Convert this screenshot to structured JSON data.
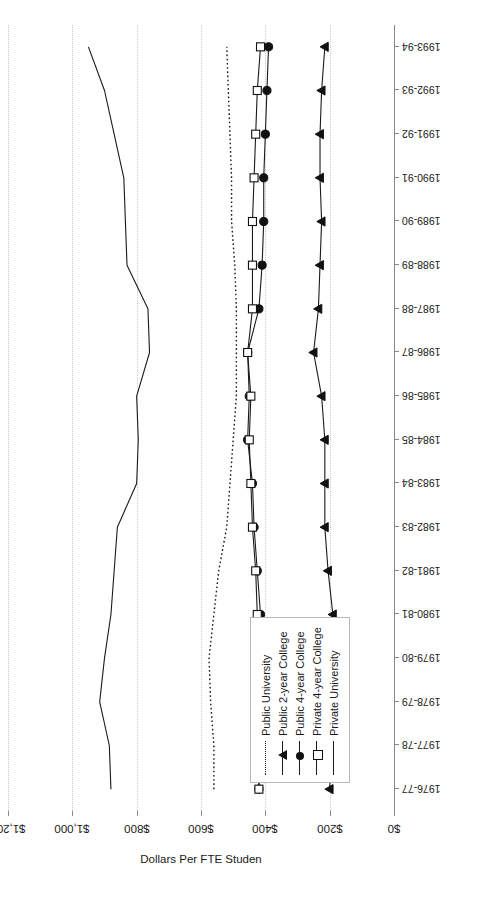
{
  "chart_data": {
    "type": "line",
    "title": "",
    "xlabel": "",
    "ylabel": "Dollars Per FTE Studen",
    "ylim": [
      0,
      1200
    ],
    "ytick_labels": [
      "$0",
      "$200",
      "$400",
      "$600",
      "$800",
      "$1,000",
      "$1,200"
    ],
    "yticks": [
      0,
      200,
      400,
      600,
      800,
      1000,
      1200
    ],
    "grid": true,
    "grid_axis": "y",
    "legend_position": "left-center",
    "orientation": "rotated-90",
    "categories": [
      "1976-77",
      "1977-78",
      "1978-79",
      "1979-80",
      "1980-81",
      "1981-82",
      "1982-83",
      "1983-84",
      "1984-85",
      "1985-86",
      "1986-87",
      "1987-88",
      "1988-89",
      "1989-90",
      "1990-91",
      "1991-92",
      "1992-93",
      "1993-94"
    ],
    "series": [
      {
        "name": "Public University",
        "marker": "none",
        "line": "dotted",
        "values": [
          560,
          560,
          570,
          575,
          560,
          545,
          520,
          510,
          500,
          490,
          490,
          490,
          495,
          505,
          505,
          510,
          515,
          520
        ]
      },
      {
        "name": "Public 2-year College",
        "marker": "triangle",
        "line": "solid",
        "values": [
          200,
          195,
          190,
          185,
          190,
          205,
          215,
          215,
          215,
          225,
          250,
          235,
          230,
          225,
          230,
          230,
          225,
          215
        ]
      },
      {
        "name": "Public 4-year College",
        "marker": "circle",
        "line": "solid",
        "values": [
          420,
          420,
          425,
          420,
          415,
          425,
          435,
          440,
          455,
          450,
          455,
          420,
          410,
          405,
          405,
          400,
          395,
          390
        ]
      },
      {
        "name": "Private 4-year College",
        "marker": "square",
        "line": "solid",
        "values": [
          420,
          420,
          420,
          420,
          425,
          430,
          440,
          445,
          450,
          445,
          455,
          440,
          440,
          440,
          435,
          430,
          425,
          415
        ]
      },
      {
        "name": "Private University",
        "marker": "none",
        "line": "solid",
        "values": [
          880,
          885,
          915,
          900,
          880,
          870,
          860,
          800,
          795,
          800,
          760,
          765,
          830,
          835,
          840,
          870,
          900,
          950
        ]
      }
    ],
    "legend": [
      {
        "label": "Public University",
        "marker": "none",
        "line": "dotted"
      },
      {
        "label": "Public 2-year College",
        "marker": "triangle",
        "line": "solid"
      },
      {
        "label": "Public 4-year College",
        "marker": "circle",
        "line": "solid"
      },
      {
        "label": "Private 4-year College",
        "marker": "square",
        "line": "solid"
      },
      {
        "label": "Private University",
        "marker": "none",
        "line": "solid"
      }
    ],
    "colors": {
      "line": "#1a1a1a",
      "grid": "#c9c9c9",
      "axis": "#8a8a8a"
    }
  }
}
